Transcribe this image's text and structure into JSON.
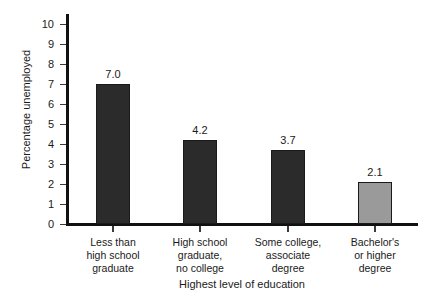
{
  "chart_data": {
    "type": "bar",
    "title": "",
    "subtitle": "",
    "xlabel": "Highest level of education",
    "ylabel": "Percentage unemployed",
    "categories": [
      "Less than\nhigh school\ngraduate",
      "High school\ngraduate,\nno college",
      "Some college,\nassociate\ndegree",
      "Bachelor's\nor higher\ndegree"
    ],
    "category_lines": [
      [
        "Less than",
        "high school",
        "graduate"
      ],
      [
        "High school",
        "graduate,",
        "no college"
      ],
      [
        "Some college,",
        "associate",
        "degree"
      ],
      [
        "Bachelor's",
        "or higher",
        "degree"
      ]
    ],
    "values": [
      7.0,
      4.2,
      3.7,
      2.1
    ],
    "value_labels": [
      "7.0",
      "4.2",
      "3.7",
      "2.1"
    ],
    "bar_colors": [
      "#2b2b2b",
      "#2b2b2b",
      "#2b2b2b",
      "#9a9a9a"
    ],
    "bar_border_color": "#1a1a1a",
    "ylim": [
      0,
      10
    ],
    "ytick_values": [
      0,
      1,
      2,
      3,
      4,
      5,
      6,
      7,
      8,
      9,
      10
    ],
    "ytick_labels": [
      "0",
      "1",
      "2",
      "3",
      "4",
      "5",
      "6",
      "7",
      "8",
      "9",
      "10"
    ],
    "grid": false,
    "legend": false,
    "legend_position": "none",
    "background_color": "#ffffff",
    "axis_color": "#111111"
  },
  "yticks": [
    {
      "label": "10",
      "value": 10
    },
    {
      "label": "9",
      "value": 9
    },
    {
      "label": "8",
      "value": 8
    },
    {
      "label": "7",
      "value": 7
    },
    {
      "label": "6",
      "value": 6
    },
    {
      "label": "5",
      "value": 5
    },
    {
      "label": "4",
      "value": 4
    },
    {
      "label": "3",
      "value": 3
    },
    {
      "label": "2",
      "value": 2
    },
    {
      "label": "1",
      "value": 1
    },
    {
      "label": "0",
      "value": 0
    }
  ],
  "bars": [
    {
      "value_label": "7.0",
      "line1": "Less than",
      "line2": "high school",
      "line3": "graduate"
    },
    {
      "value_label": "4.2",
      "line1": "High school",
      "line2": "graduate,",
      "line3": "no college"
    },
    {
      "value_label": "3.7",
      "line1": "Some college,",
      "line2": "associate",
      "line3": "degree"
    },
    {
      "value_label": "2.1",
      "line1": "Bachelor's",
      "line2": "or higher",
      "line3": "degree"
    }
  ],
  "axes": {
    "y_title": "Percentage unemployed",
    "x_title": "Highest level of education"
  }
}
